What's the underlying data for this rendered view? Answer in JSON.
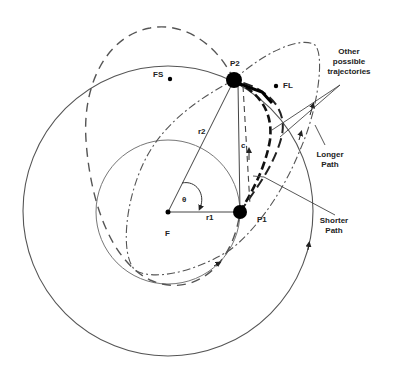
{
  "diagram": {
    "points": {
      "F": {
        "label": "F",
        "x": 168,
        "y": 212
      },
      "P1": {
        "label": "P1",
        "x": 240,
        "y": 212
      },
      "P2": {
        "label": "P2",
        "x": 234,
        "y": 80
      },
      "FS": {
        "label": "FS",
        "x": 170,
        "y": 79
      },
      "FL": {
        "label": "FL",
        "x": 276,
        "y": 85
      }
    },
    "labels": {
      "r1": "r1",
      "r2": "r2",
      "c": "c",
      "theta": "θ",
      "other_line1": "Other",
      "other_line2": "possible",
      "other_line3": "trajectories",
      "longer_line1": "Longer",
      "longer_line2": "Path",
      "shorter_line1": "Shorter",
      "shorter_line2": "Path"
    },
    "colors": {
      "line": "#444444",
      "dot": "#000000",
      "background": "#ffffff"
    }
  }
}
